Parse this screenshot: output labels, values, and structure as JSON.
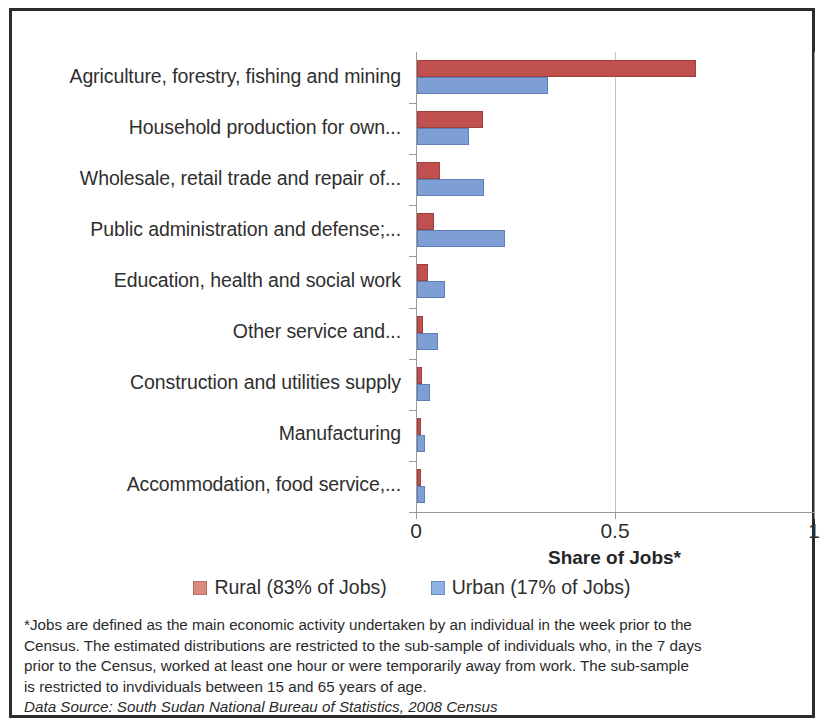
{
  "chart_data": {
    "type": "bar",
    "orientation": "horizontal",
    "grouped": true,
    "title": "",
    "xlabel": "Share of Jobs*",
    "ylabel": "",
    "xlim": [
      0,
      1
    ],
    "xticks": [
      "0",
      "0.5",
      "1"
    ],
    "xtick_values": [
      0,
      0.5,
      1
    ],
    "grid": "vertical gridline at 0.5 and 1",
    "legend_position": "below plot, centered",
    "categories": [
      "Agriculture, forestry, fishing and mining",
      "Household production for own...",
      "Wholesale, retail trade and repair of...",
      "Public administration and defense;...",
      "Education, health and social work",
      "Other service and...",
      "Construction and utilities supply",
      "Manufacturing",
      "Accommodation, food service,..."
    ],
    "series": [
      {
        "name": "Rural (83% of Jobs)",
        "color": "#C0504D",
        "values": [
          0.7,
          0.165,
          0.057,
          0.042,
          0.028,
          0.015,
          0.013,
          0.011,
          0.009
        ]
      },
      {
        "name": "Urban (17% of Jobs)",
        "color": "#7E9FD6",
        "values": [
          0.33,
          0.13,
          0.168,
          0.222,
          0.07,
          0.053,
          0.033,
          0.021,
          0.02
        ]
      }
    ]
  },
  "axis": {
    "title": "Share of Jobs*"
  },
  "legend": [
    {
      "label": "Rural (83% of Jobs)",
      "swatch": "rural"
    },
    {
      "label": "Urban (17% of Jobs)",
      "swatch": "urban"
    }
  ],
  "footnote": {
    "line1": "*Jobs are defined as the main economic activity undertaken by an individual in the week prior to the",
    "line2": "Census. The estimated distributions are restricted to the sub-sample of individuals who, in the 7 days",
    "line3": "prior to the Census, worked at least one hour or were temporarily away from work.  The sub-sample",
    "line4": "is restricted to invdividuals between 15 and 65 years of age.",
    "source": "Data Source: South Sudan National Bureau of Statistics, 2008 Census"
  }
}
